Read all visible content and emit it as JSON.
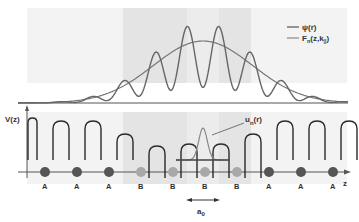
{
  "figure": {
    "legend": {
      "psi_label": "ψ(r)",
      "envelope_label_main": "F",
      "envelope_label_sub": "n",
      "envelope_label_args": "(z,k",
      "envelope_label_args_sub": "||",
      "envelope_label_close": ")"
    },
    "axis": {
      "y_label": "V(z)",
      "x_label": "z"
    },
    "bloch_label_main": "u",
    "bloch_label_sub": "n",
    "bloch_label_args": "(r)",
    "lattice_label_main": "a",
    "lattice_label_sub": "0",
    "sites": [
      "A",
      "A",
      "A",
      "B",
      "B",
      "B",
      "B",
      "A",
      "A",
      "A"
    ],
    "site_types": {
      "A": {
        "color": "#555555"
      },
      "B": {
        "color": "#a8a8a8"
      }
    },
    "colors": {
      "curve": "#666666",
      "potential": "#2a2a2a",
      "band_light": "#f1f1f1",
      "band_dark": "#e2e2e2",
      "axis": "#444444"
    }
  }
}
